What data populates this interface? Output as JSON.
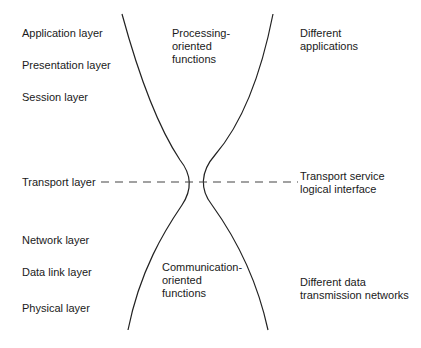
{
  "diagram": {
    "type": "hourglass-osi-layers",
    "left_layers": [
      {
        "label": "Application layer"
      },
      {
        "label": "Presentation layer"
      },
      {
        "label": "Session layer"
      },
      {
        "label": "Transport layer"
      },
      {
        "label": "Network layer"
      },
      {
        "label": "Data link layer"
      },
      {
        "label": "Physical layer"
      }
    ],
    "top_region": "Processing-\noriented\nfunctions",
    "bottom_region": "Communication-\noriented\nfunctions",
    "right_top": "Different\napplications",
    "right_middle": "Transport service\nlogical interface",
    "right_bottom": "Different data\ntransmission networks",
    "colors": {
      "line": "#222222",
      "dash": "#444444",
      "text": "#1a1a1a"
    }
  }
}
